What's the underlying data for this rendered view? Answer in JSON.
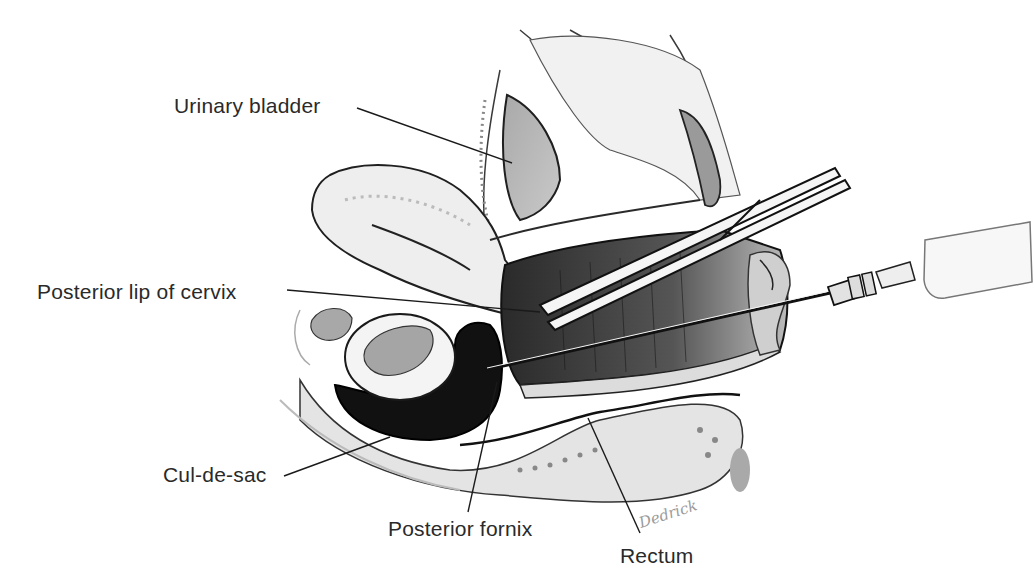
{
  "figure": {
    "labels": {
      "urinary_bladder": "Urinary bladder",
      "posterior_lip_of_cervix": "Posterior lip of cervix",
      "cul_de_sac": "Cul-de-sac",
      "posterior_fornix": "Posterior fornix",
      "rectum": "Rectum"
    },
    "signature": "Dedrick",
    "colors": {
      "ink": "#1a1a1a",
      "label_text": "#2a2a2a",
      "tissue_light": "#e9e9e9",
      "tissue_mid": "#b8b8b8",
      "tissue_dark": "#6a6a6a",
      "fluid_black": "#111111",
      "background": "#ffffff"
    }
  }
}
